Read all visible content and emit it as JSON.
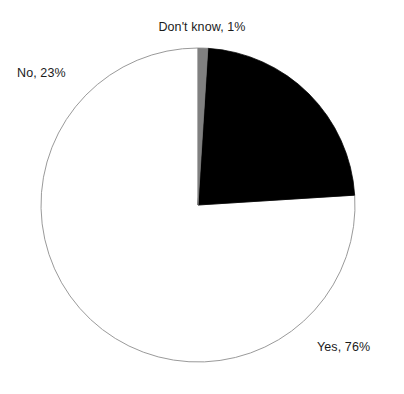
{
  "chart_data": {
    "type": "pie",
    "title": "",
    "subtitle": "",
    "xlabel": "",
    "ylabel": "",
    "grid": false,
    "legend_position": "none",
    "labels_outside": true,
    "start_angle_deg": 90,
    "direction": "counterclockwise",
    "categories": [
      "Yes",
      "No",
      "Don't know"
    ],
    "values": [
      76,
      23,
      1
    ],
    "unit": "%",
    "colors": [
      "#ffffff",
      "#000000",
      "#808080"
    ],
    "outline_color": "#9a9a9a",
    "background": "#ffffff",
    "text_color": "#1b1b1b",
    "slices": [
      {
        "name": "Yes",
        "value": 76,
        "label": "Yes, 76%",
        "color": "#ffffff",
        "stroke": "#9a9a9a"
      },
      {
        "name": "No",
        "value": 23,
        "label": "No, 23%",
        "color": "#000000",
        "stroke": "#000000"
      },
      {
        "name": "Don't know",
        "value": 1,
        "label": "Don't know, 1%",
        "color": "#808080",
        "stroke": "#808080"
      }
    ],
    "geometry": {
      "center_x": 198,
      "center_y": 205,
      "radius": 157
    }
  },
  "labels": {
    "yes": "Yes, 76%",
    "no": "No, 23%",
    "dont_know": "Don't know, 1%"
  }
}
